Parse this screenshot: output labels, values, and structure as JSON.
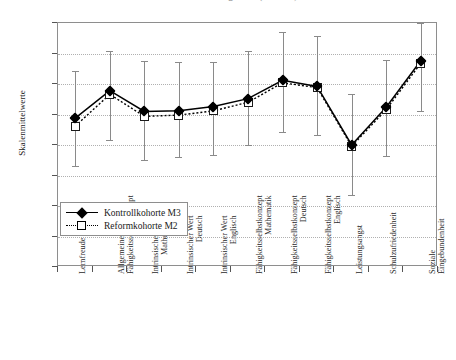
{
  "chart_data": {
    "type": "line",
    "title": "Pemrnalsuhen dargestellt (N = 452)",
    "xlabel": "",
    "ylabel": "Skalenmittelwerte",
    "ylim": [
      0.0,
      4.0
    ],
    "ytick_labels": [
      "0.00",
      "0.50",
      "1.00",
      "1.50",
      "2.00",
      "2.50",
      "3.00",
      "3.50",
      "4.00"
    ],
    "ytick_values": [
      0.0,
      0.5,
      1.0,
      1.5,
      2.0,
      2.5,
      3.0,
      3.5,
      4.0
    ],
    "grid": true,
    "legend_position": "lower-left-inside",
    "categories": [
      "Lernfreude",
      "Allgemeines Fähigkeitsselbstkonzept",
      "Intrinsischer Wert Mathematik",
      "Intrinsischer Wert Deutsch",
      "Intrinsischer Wert Englisch",
      "Fähigkeitsselbstkonzept Mathematik",
      "Fähigkeitsselbstkonzept Deutsch",
      "Fähigkeitsselbstkonzept Englisch",
      "Leistungsangst",
      "Schulzufriedenheit",
      "Soziale Eingebundenheit"
    ],
    "category_lines": [
      [
        "Lernfreude",
        ""
      ],
      [
        "Allgemeines",
        "Fähigkeitsselbstkonzept"
      ],
      [
        "Intrinsischer Wert",
        "Mathematik"
      ],
      [
        "Intrinsischer Wert",
        "Deutsch"
      ],
      [
        "Intrinsischer Wert",
        "Englisch"
      ],
      [
        "Fähigkeitsselbstkonzept",
        "Mathematik"
      ],
      [
        "Fähigkeitsselbstkonzept",
        "Deutsch"
      ],
      [
        "Fähigkeitsselbstkonzept",
        "Englisch"
      ],
      [
        "Leistungsangst",
        ""
      ],
      [
        "Schulzufriedenheit",
        ""
      ],
      [
        "Soziale",
        "Eingebundenheit"
      ]
    ],
    "series": [
      {
        "name": "Kontrollkohorte M3",
        "marker": "filled-diamond",
        "line": "solid",
        "values": [
          2.44,
          2.89,
          2.55,
          2.56,
          2.63,
          2.76,
          3.06,
          2.96,
          2.0,
          2.62,
          3.38
        ],
        "err_low": [
          1.66,
          2.08,
          1.75,
          1.8,
          1.84,
          2.0,
          2.22,
          2.16,
          1.18,
          1.82,
          2.56
        ],
        "err_high": [
          3.22,
          3.54,
          3.38,
          3.36,
          3.36,
          3.54,
          3.86,
          3.78,
          2.84,
          3.4,
          4.0
        ]
      },
      {
        "name": "Reformkohorte M2",
        "marker": "open-square",
        "line": "dotted",
        "values": [
          2.31,
          2.83,
          2.47,
          2.49,
          2.56,
          2.7,
          3.02,
          2.94,
          1.98,
          2.58,
          3.34
        ],
        "err_low": [
          1.66,
          2.08,
          1.75,
          1.8,
          1.84,
          2.0,
          2.22,
          2.16,
          1.18,
          1.82,
          2.56
        ],
        "err_high": [
          3.22,
          3.54,
          3.38,
          3.36,
          3.36,
          3.54,
          3.86,
          3.78,
          2.84,
          3.4,
          4.0
        ]
      }
    ]
  },
  "legend": {
    "items": [
      {
        "label": "Kontrollkohorte M3"
      },
      {
        "label": "Reformkohorte M2"
      }
    ]
  },
  "colors": {
    "series_1": "#000000",
    "series_2": "#000000",
    "error_bar": "#8a8a8a",
    "grid": "#b0b0b0",
    "axis": "#8e8e8e"
  }
}
